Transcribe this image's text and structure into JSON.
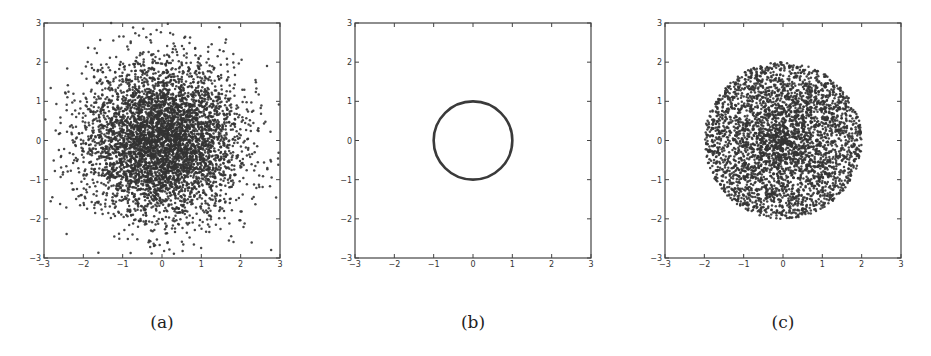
{
  "figure": {
    "panels": [
      {
        "id": "a",
        "caption": "(a)",
        "frame": {
          "left": 44,
          "top": 23,
          "right": 280,
          "bottom": 258
        }
      },
      {
        "id": "b",
        "caption": "(b)",
        "frame": {
          "left": 355,
          "top": 23,
          "right": 591,
          "bottom": 258
        }
      },
      {
        "id": "c",
        "caption": "(c)",
        "frame": {
          "left": 665,
          "top": 23,
          "right": 901,
          "bottom": 258
        }
      }
    ]
  },
  "chart_data": [
    {
      "type": "scatter",
      "title": "",
      "caption": "(a)",
      "description": "Samples from a 2D standard normal distribution",
      "distribution": "gaussian",
      "params": {
        "mean": [
          0,
          0
        ],
        "std": 1,
        "n_points": 5000,
        "seed": 11
      },
      "xlim": [
        -3,
        3
      ],
      "ylim": [
        -3,
        3
      ],
      "xticks": [
        -3,
        -2,
        -1,
        0,
        1,
        2,
        3
      ],
      "yticks": [
        -3,
        -2,
        -1,
        0,
        1,
        2,
        3
      ],
      "xlabel": "",
      "ylabel": "",
      "grid": false,
      "marker_color": "#333333"
    },
    {
      "type": "line",
      "title": "",
      "caption": "(b)",
      "description": "Unit circle (radius 1, centered at origin)",
      "distribution": "circle",
      "params": {
        "radius": 1,
        "center": [
          0,
          0
        ]
      },
      "xlim": [
        -3,
        3
      ],
      "ylim": [
        -3,
        3
      ],
      "xticks": [
        -3,
        -2,
        -1,
        0,
        1,
        2,
        3
      ],
      "yticks": [
        -3,
        -2,
        -1,
        0,
        1,
        2,
        3
      ],
      "xlabel": "",
      "ylabel": "",
      "grid": false,
      "line_color": "#3a3a3a"
    },
    {
      "type": "scatter",
      "title": "",
      "caption": "(c)",
      "description": "Points filling a disk of radius ~2, denser near the center",
      "distribution": "disk",
      "params": {
        "radius": 2,
        "n_points": 3500,
        "seed": 7
      },
      "xlim": [
        -3,
        3
      ],
      "ylim": [
        -3,
        3
      ],
      "xticks": [
        -3,
        -2,
        -1,
        0,
        1,
        2,
        3
      ],
      "yticks": [
        -3,
        -2,
        -1,
        0,
        1,
        2,
        3
      ],
      "xlabel": "",
      "ylabel": "",
      "grid": false,
      "marker_color": "#333333"
    }
  ]
}
